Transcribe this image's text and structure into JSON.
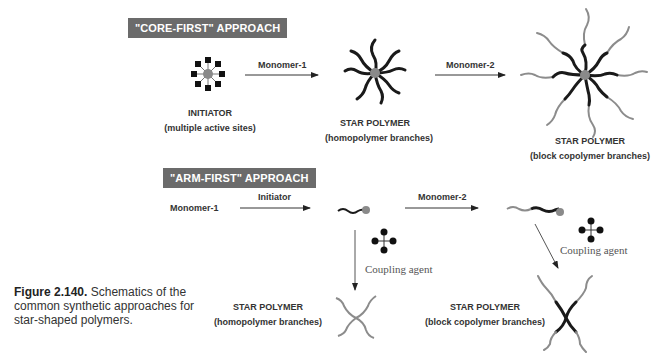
{
  "top_cut_text": "...",
  "core_first": {
    "banner": "\"CORE-FIRST\" APPROACH",
    "initiator_label": "INITIATOR",
    "initiator_sub": "(multiple active sites)",
    "arrow1_label": "Monomer-1",
    "star1_label": "STAR POLYMER",
    "star1_sub": "(homopolymer branches)",
    "arrow2_label": "Monomer-2",
    "star2_label": "STAR POLYMER",
    "star2_sub": "(block copolymer branches)"
  },
  "arm_first": {
    "banner": "\"ARM-FIRST\" APPROACH",
    "start_label": "Monomer-1",
    "arrow1_label": "Initiator",
    "arrow2_label": "Monomer-2",
    "coupling_left": "Coupling agent",
    "coupling_right": "Coupling agent",
    "star_left_label": "STAR POLYMER",
    "star_left_sub": "(homopolymer branches)",
    "star_right_label": "STAR POLYMER",
    "star_right_sub": "(block copolymer branches)"
  },
  "caption": {
    "number": "Figure 2.140.",
    "text": "Schematics of the common synthetic approaches for star-shaped polymers."
  },
  "colors": {
    "banner_bg": "#6b6b6b",
    "core": "#8a8a8a",
    "dark_arm": "#1a1a1a",
    "light_arm": "#8c8c8c"
  }
}
